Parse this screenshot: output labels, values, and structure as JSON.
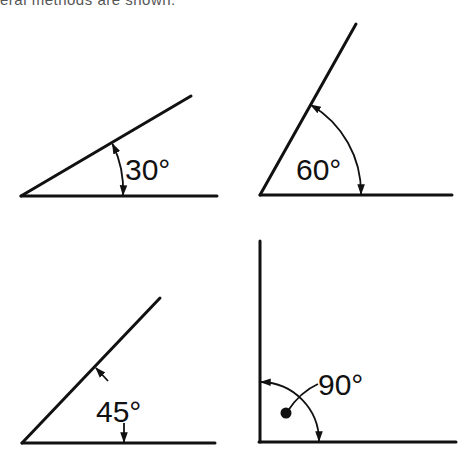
{
  "caption": "eral methods are shown.",
  "angles": [
    {
      "id": "angle-30",
      "label": "30°",
      "degrees": 30
    },
    {
      "id": "angle-60",
      "label": "60°",
      "degrees": 60
    },
    {
      "id": "angle-45",
      "label": "45°",
      "degrees": 45
    },
    {
      "id": "angle-90",
      "label": "90°",
      "degrees": 90
    }
  ],
  "colors": {
    "stroke": "#111111",
    "background": "#ffffff"
  }
}
